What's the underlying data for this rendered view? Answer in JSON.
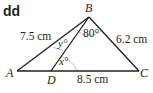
{
  "part_label": "dd",
  "vertices": {
    "A": {
      "label": "A"
    },
    "B": {
      "label": "B"
    },
    "C": {
      "label": "C"
    },
    "D": {
      "label": "D"
    }
  },
  "sides": {
    "AB": "7.5 cm",
    "BC": "6.2 cm",
    "DC": "8.5 cm"
  },
  "angles": {
    "DBC": "80°",
    "ABD": "y°",
    "BDC": "x°"
  },
  "colors": {
    "line": "#231f20",
    "arc": "#b3b3b3"
  }
}
